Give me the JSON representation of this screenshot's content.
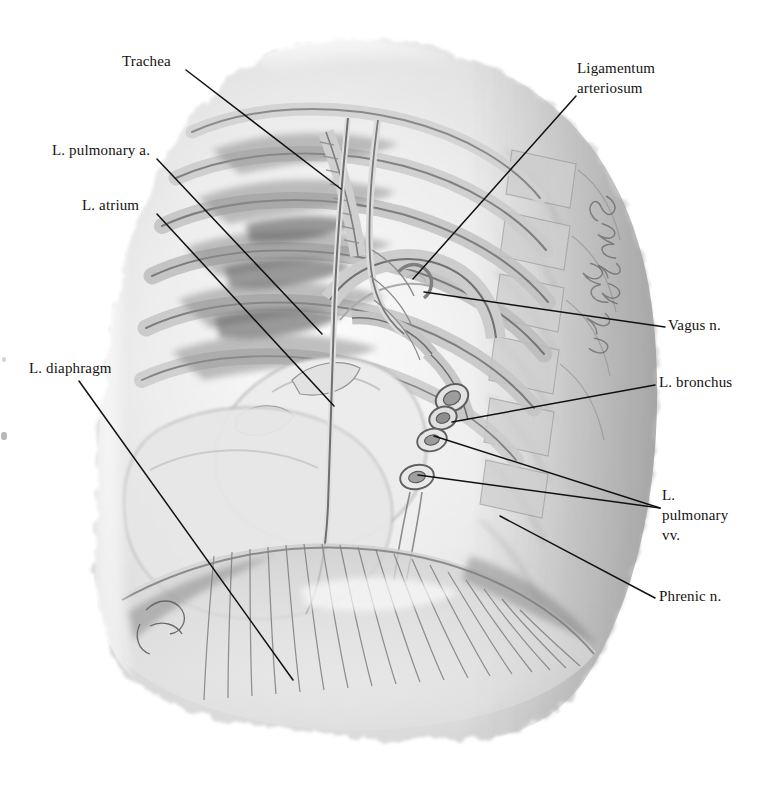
{
  "plate": {
    "kind": "anatomical-illustration",
    "subject": "Left mediastinum and pulmonary hilum, left lateral view",
    "technique": "grayscale wash / watercolor",
    "signature": "Bert Schwarzschild",
    "background_color": "#ffffff",
    "ink_color": "#15120f",
    "leader_color": "#111111"
  },
  "labels": {
    "trachea": "Trachea",
    "l_pulmonary_a": "L. pulmonary a.",
    "l_atrium": "L. atrium",
    "l_diaphragm": "L. diaphragm",
    "ligamentum_arteriosum": "Ligamentum\narteriosum",
    "vagus_n": "Vagus n.",
    "l_bronchus": "L. bronchus",
    "l_pulmonary_vv": "L.\npulmonary\nvv.",
    "phrenic_n": "Phrenic n."
  },
  "leaders": [
    {
      "name": "trachea",
      "from": [
        186,
        70
      ],
      "to": [
        341,
        189
      ]
    },
    {
      "name": "l-pulmonary-a",
      "from": [
        157,
        159
      ],
      "to": [
        322,
        334
      ]
    },
    {
      "name": "l-atrium",
      "from": [
        157,
        214
      ],
      "to": [
        334,
        406
      ]
    },
    {
      "name": "l-diaphragm",
      "from": [
        79,
        381
      ],
      "to": [
        293,
        680
      ]
    },
    {
      "name": "ligamentum-arteriosum",
      "from": [
        576,
        96
      ],
      "to": [
        413,
        279
      ]
    },
    {
      "name": "vagus-n",
      "from": [
        665,
        327
      ],
      "to": [
        424,
        292
      ]
    },
    {
      "name": "l-bronchus",
      "from": [
        655,
        385
      ],
      "to": [
        452,
        422
      ]
    },
    {
      "name": "l-pulmonary-vv-upper",
      "from": [
        660,
        508
      ],
      "to": [
        434,
        436
      ]
    },
    {
      "name": "l-pulmonary-vv-lower",
      "from": [
        660,
        508
      ],
      "to": [
        418,
        475
      ]
    },
    {
      "name": "phrenic-n",
      "from": [
        655,
        598
      ],
      "to": [
        500,
        516
      ]
    }
  ],
  "figure_regions": [
    {
      "name": "lung-field",
      "description": "pale translucent left lung silhouette"
    },
    {
      "name": "rib-cage",
      "description": "stacked ribs and costal cartilages upper-left"
    },
    {
      "name": "vertebral-column",
      "description": "vertebral bodies along posterior right border"
    },
    {
      "name": "left-atrium",
      "description": "rounded chamber left of hilum"
    },
    {
      "name": "hilum",
      "description": "bronchus and pulmonary vessel cut-ends, centre"
    },
    {
      "name": "diaphragm",
      "description": "radiating muscular fibres across lower third"
    },
    {
      "name": "phrenic-nerve",
      "description": "long slender nerve descending over pericardium"
    }
  ]
}
